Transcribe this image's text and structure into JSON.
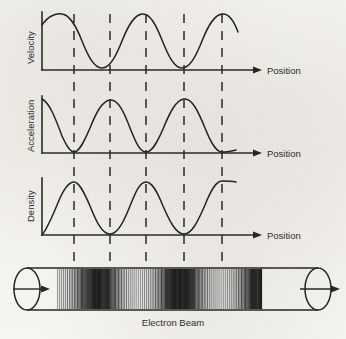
{
  "figure": {
    "beam_caption": "Electron Beam",
    "axis_caption": "Position",
    "line_color": "#232323",
    "background_color": "#f5f4f1"
  },
  "panels": [
    {
      "id": "velocity",
      "ylabel": "Velocity",
      "xlabel": "Position"
    },
    {
      "id": "acceleration",
      "ylabel": "Acceleration",
      "xlabel": "Position"
    },
    {
      "id": "density",
      "ylabel": "Density",
      "xlabel": "Position"
    }
  ],
  "chart_data": [
    {
      "type": "line",
      "title": "Velocity",
      "xlabel": "Position",
      "ylabel": "Velocity",
      "grid": false,
      "legend": "none",
      "xlim": [
        0,
        2.5
      ],
      "ylim": [
        -1,
        1
      ],
      "description": "Cosine-like velocity modulation, starts near maximum, two and a half cycles across the position axis",
      "x": [
        0.0,
        0.125,
        0.25,
        0.375,
        0.5,
        0.625,
        0.75,
        0.875,
        1.0,
        1.125,
        1.25,
        1.375,
        1.5,
        1.625,
        1.75,
        1.875,
        2.0,
        2.125,
        2.25,
        2.375,
        2.5
      ],
      "values": [
        0.62,
        0.95,
        1.0,
        0.72,
        0.0,
        -0.72,
        -1.0,
        -0.72,
        0.0,
        0.72,
        1.0,
        0.72,
        0.0,
        -0.72,
        -1.0,
        -0.72,
        0.0,
        0.72,
        1.0,
        0.72,
        0.15
      ],
      "reference_lines": [
        0.5,
        1.0,
        1.5,
        2.0,
        2.5
      ]
    },
    {
      "type": "line",
      "title": "Acceleration",
      "xlabel": "Position",
      "ylabel": "Acceleration",
      "grid": false,
      "legend": "none",
      "xlim": [
        0,
        2.5
      ],
      "ylim": [
        0,
        1
      ],
      "description": "Rectified acceleration curve, zero minima at reference lines 1, 3 and 5, maxima at reference lines 2 and 4",
      "x": [
        0.0,
        0.125,
        0.25,
        0.375,
        0.5,
        0.625,
        0.75,
        0.875,
        1.0,
        1.125,
        1.25,
        1.375,
        1.5,
        1.625,
        1.75,
        1.875,
        2.0,
        2.125,
        2.25,
        2.375,
        2.5
      ],
      "values": [
        1.0,
        0.85,
        0.5,
        0.15,
        0.0,
        0.15,
        0.5,
        0.85,
        1.0,
        0.85,
        0.5,
        0.15,
        0.0,
        0.15,
        0.5,
        0.85,
        1.0,
        0.85,
        0.5,
        0.15,
        0.0
      ],
      "reference_lines": [
        0.5,
        1.0,
        1.5,
        2.0,
        2.5
      ]
    },
    {
      "type": "line",
      "title": "Density",
      "xlabel": "Position",
      "ylabel": "Density",
      "grid": false,
      "legend": "none",
      "xlim": [
        0,
        2.5
      ],
      "ylim": [
        0,
        1
      ],
      "description": "Electron bunching density, zero at origin, peaks at reference lines 1, 3 and 5, zero at reference lines 2 and 4",
      "x": [
        0.0,
        0.125,
        0.25,
        0.375,
        0.5,
        0.625,
        0.75,
        0.875,
        1.0,
        1.125,
        1.25,
        1.375,
        1.5,
        1.625,
        1.75,
        1.875,
        2.0,
        2.125,
        2.25,
        2.375,
        2.5
      ],
      "values": [
        0.0,
        0.18,
        0.5,
        0.85,
        1.0,
        0.85,
        0.5,
        0.15,
        0.0,
        0.15,
        0.5,
        0.85,
        1.0,
        0.85,
        0.5,
        0.15,
        0.0,
        0.15,
        0.5,
        0.85,
        1.0
      ],
      "reference_lines": [
        0.5,
        1.0,
        1.5,
        2.0,
        2.5
      ]
    }
  ],
  "beam": {
    "caption": "Electron Beam",
    "entry_arrow": "arrow-right",
    "exit_arrow": "arrow-right",
    "bunch_centers": [
      0.5,
      1.5,
      2.5
    ],
    "description": "Cylindrical drift tube with vertical electron lines bunched at density maxima"
  }
}
